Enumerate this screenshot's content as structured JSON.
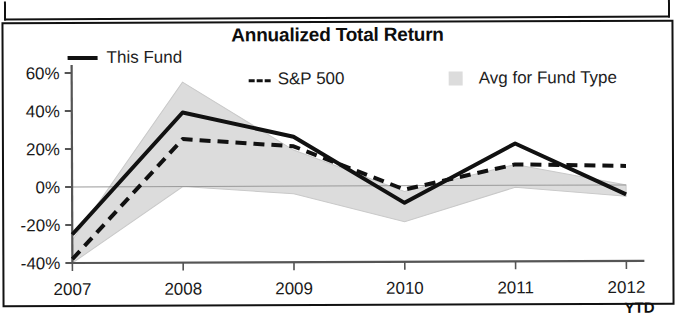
{
  "chart_data": {
    "type": "line",
    "title": "Annualized Total Return",
    "xlabel": "",
    "ylabel": "",
    "x": [
      "2007",
      "2008",
      "2009",
      "2010",
      "2011",
      "2012"
    ],
    "categories": [
      "2007",
      "2008",
      "2009",
      "2010",
      "2011",
      "2012"
    ],
    "xtick_labels": [
      "2007",
      "2008",
      "2009",
      "2010",
      "2011",
      "2012"
    ],
    "x_axis_note": "YTD",
    "ytick_labels": [
      "60%",
      "40%",
      "20%",
      "0%",
      "-20%",
      "-40%"
    ],
    "ytick_values": [
      60,
      40,
      20,
      0,
      -20,
      -40
    ],
    "ylim": [
      -40,
      60
    ],
    "grid": false,
    "legend_position": "top",
    "series": [
      {
        "name": "This Fund",
        "style": "solid",
        "color": "#111111",
        "values": [
          -25,
          39,
          26,
          -9,
          22,
          -5
        ]
      },
      {
        "name": "S&P 500",
        "style": "dashed",
        "color": "#111111",
        "values": [
          -38,
          25,
          21,
          -2,
          11,
          10
        ]
      },
      {
        "name": "Avg for Fund Type",
        "style": "area",
        "color": "#dcdcdc",
        "upper": [
          -28,
          55,
          19,
          -3,
          11,
          0
        ],
        "lower": [
          -40,
          0,
          -4,
          -19,
          -1,
          -6
        ],
        "values": [
          -34,
          27,
          7,
          -11,
          5,
          -3
        ]
      }
    ]
  },
  "legend": {
    "fund_label": "This Fund",
    "sp_label": "S&P 500",
    "avg_label": "Avg for Fund Type"
  },
  "colors": {
    "line": "#111111",
    "area": "#dcdcdc",
    "axis": "#555555",
    "border": "#111111"
  }
}
